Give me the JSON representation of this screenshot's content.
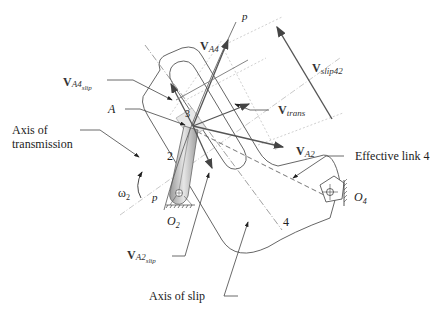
{
  "figure": {
    "labels": {
      "p_top": "p",
      "p_bottom": "p",
      "v_a4": {
        "main": "V",
        "sub": "A4"
      },
      "v_a4_slip": {
        "main": "V",
        "sub": "A4",
        "subsub": "slip"
      },
      "v_slip42": {
        "main": "V",
        "sub": "slip42"
      },
      "v_trans": {
        "main": "V",
        "sub": "trans"
      },
      "v_a2": {
        "main": "V",
        "sub": "A2"
      },
      "v_a2_slip": {
        "main": "V",
        "sub": "A2",
        "subsub": "slip"
      },
      "point_a": "A",
      "axis_transmission_1": "Axis of",
      "axis_transmission_2": "transmission",
      "link_2": "2",
      "link_3": "3",
      "link_4": "4",
      "omega": "ω",
      "omega_sub": "2",
      "o2": "O",
      "o2_sub": "2",
      "o4": "O",
      "o4_sub": "4",
      "effective_link": "Effective link 4",
      "axis_slip": "Axis of slip"
    }
  }
}
